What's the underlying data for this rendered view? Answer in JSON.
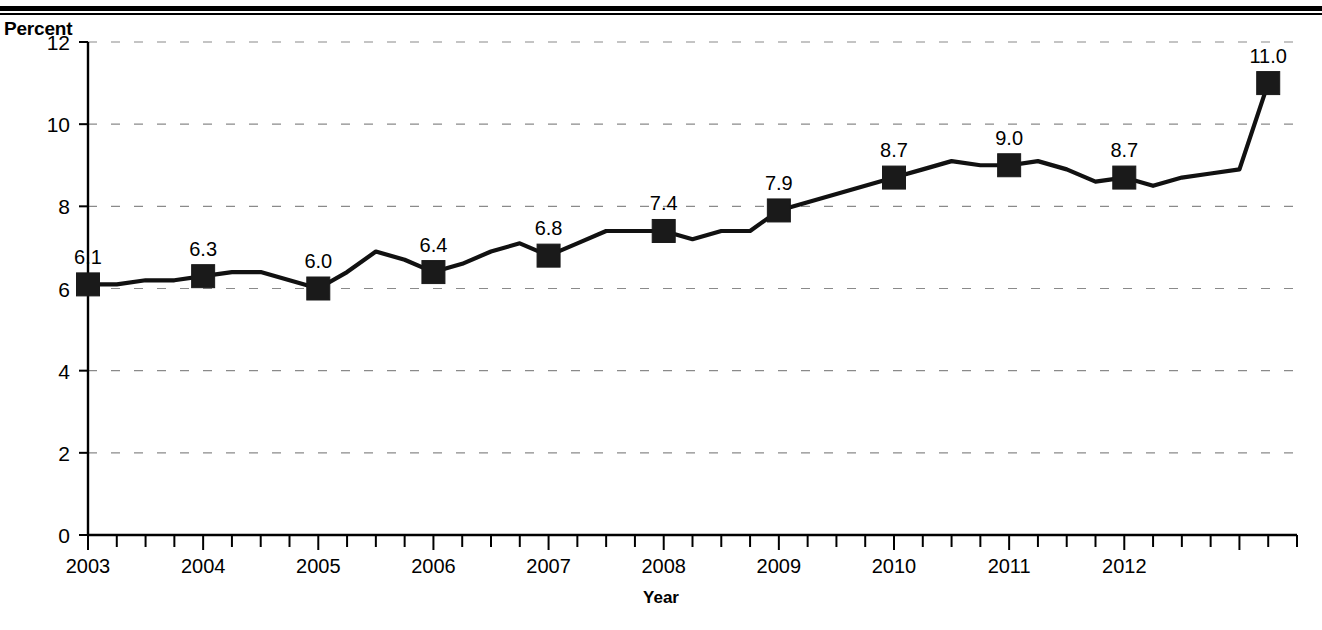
{
  "figure": {
    "y_axis_title": "Percent",
    "x_axis_title": "Year",
    "has_top_rule": true
  },
  "chart_data": {
    "type": "line",
    "title": "",
    "subtitle": "",
    "xlabel": "Year",
    "ylabel": "Percent",
    "xlim": [
      2003.0,
      2013.5
    ],
    "ylim": [
      0,
      12
    ],
    "grid": true,
    "grid_axis": "y",
    "legend": false,
    "legend_position": "none",
    "y_ticks": [
      0,
      2,
      4,
      6,
      8,
      10,
      12
    ],
    "y_tick_labels": [
      "0",
      "2",
      "4",
      "6",
      "8",
      "10",
      "12"
    ],
    "x_ticks": [
      2003,
      2004,
      2005,
      2006,
      2007,
      2008,
      2009,
      2010,
      2011,
      2012
    ],
    "x_tick_labels": [
      "2003",
      "2004",
      "2005",
      "2006",
      "2007",
      "2008",
      "2009",
      "2010",
      "2011",
      "2012"
    ],
    "x_minor_tick_interval": 0.25,
    "marker_style": "filled-square",
    "line_color": "#111111",
    "marker_color": "#1a1a1a",
    "labeled_points": [
      {
        "x": 2003.0,
        "y": 6.1,
        "label": "6.1"
      },
      {
        "x": 2004.0,
        "y": 6.3,
        "label": "6.3"
      },
      {
        "x": 2005.0,
        "y": 6.0,
        "label": "6.0"
      },
      {
        "x": 2006.0,
        "y": 6.4,
        "label": "6.4"
      },
      {
        "x": 2007.0,
        "y": 6.8,
        "label": "6.8"
      },
      {
        "x": 2008.0,
        "y": 7.4,
        "label": "7.4"
      },
      {
        "x": 2009.0,
        "y": 7.9,
        "label": "7.9"
      },
      {
        "x": 2010.0,
        "y": 8.7,
        "label": "8.7"
      },
      {
        "x": 2011.0,
        "y": 9.0,
        "label": "9.0"
      },
      {
        "x": 2012.0,
        "y": 8.7,
        "label": "8.7"
      },
      {
        "x": 2013.25,
        "y": 11.0,
        "label": "11.0"
      }
    ],
    "x": [
      2003.0,
      2003.25,
      2003.5,
      2003.75,
      2004.0,
      2004.25,
      2004.5,
      2004.75,
      2005.0,
      2005.25,
      2005.5,
      2005.75,
      2006.0,
      2006.25,
      2006.5,
      2006.75,
      2007.0,
      2007.25,
      2007.5,
      2007.75,
      2008.0,
      2008.25,
      2008.5,
      2008.75,
      2009.0,
      2009.25,
      2009.5,
      2009.75,
      2010.0,
      2010.25,
      2010.5,
      2010.75,
      2011.0,
      2011.25,
      2011.5,
      2011.75,
      2012.0,
      2012.25,
      2012.5,
      2012.75,
      2013.0,
      2013.25
    ],
    "values": [
      6.1,
      6.1,
      6.2,
      6.2,
      6.3,
      6.4,
      6.4,
      6.2,
      6.0,
      6.4,
      6.9,
      6.7,
      6.4,
      6.6,
      6.9,
      7.1,
      6.8,
      7.1,
      7.4,
      7.4,
      7.4,
      7.2,
      7.4,
      7.4,
      7.9,
      8.1,
      8.3,
      8.5,
      8.7,
      8.9,
      9.1,
      9.0,
      9.0,
      9.1,
      8.9,
      8.6,
      8.7,
      8.5,
      8.7,
      8.8,
      8.9,
      11.0
    ]
  }
}
